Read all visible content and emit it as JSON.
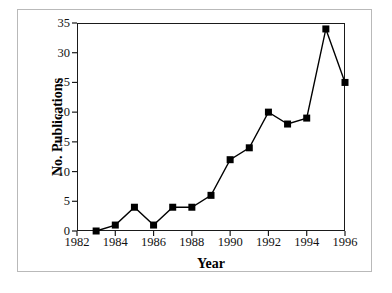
{
  "chart_data": {
    "type": "line",
    "title": "",
    "subtitle": "",
    "xlabel": "Year",
    "ylabel": "No. Publications",
    "x": [
      1983,
      1984,
      1985,
      1986,
      1987,
      1988,
      1989,
      1990,
      1991,
      1992,
      1993,
      1994,
      1995,
      1996
    ],
    "values": [
      0,
      1,
      4,
      1,
      4,
      4,
      6,
      12,
      14,
      20,
      18,
      19,
      34,
      25
    ],
    "series": [
      {
        "name": "No. Publications",
        "values": [
          0,
          1,
          4,
          1,
          4,
          4,
          6,
          12,
          14,
          20,
          18,
          19,
          34,
          25
        ]
      }
    ],
    "xlim": [
      1982,
      1996
    ],
    "ylim": [
      0,
      35
    ],
    "xticks": [
      1982,
      1984,
      1986,
      1988,
      1990,
      1992,
      1994,
      1996
    ],
    "xtick_labels": [
      "1982",
      "1984",
      "1986",
      "1988",
      "1990",
      "1992",
      "1994",
      "1996"
    ],
    "yticks": [
      0,
      5,
      10,
      15,
      20,
      25,
      30,
      35
    ],
    "ytick_labels": [
      "0",
      "5",
      "10",
      "15",
      "20",
      "25",
      "30",
      "35"
    ],
    "grid": false,
    "legend": false,
    "legend_position": "none",
    "marker": "square",
    "marker_color": "#000000",
    "line_color": "#000000",
    "background_color": "#ffffff",
    "frame_color": "#1a1a1a",
    "outer_border_color": "#b9b9b9",
    "annotations": []
  }
}
